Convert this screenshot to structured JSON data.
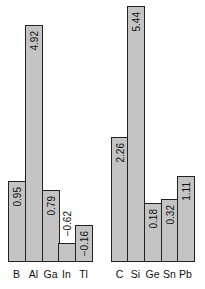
{
  "chart_data": [
    {
      "type": "bar",
      "title": "",
      "xlabel": "",
      "ylabel": "",
      "categories": [
        "B",
        "Al",
        "Ga",
        "In",
        "Tl"
      ],
      "values": [
        0.95,
        4.92,
        0.79,
        -0.62,
        -0.16
      ],
      "value_labels": [
        "0.95",
        "4.92",
        "0.79",
        "−0.62",
        "−0.16"
      ],
      "grid": false,
      "legend": null
    },
    {
      "type": "bar",
      "title": "",
      "xlabel": "",
      "ylabel": "",
      "categories": [
        "C",
        "Si",
        "Ge",
        "Sn",
        "Pb"
      ],
      "values": [
        2.26,
        5.44,
        0.18,
        0.32,
        1.11
      ],
      "value_labels": [
        "2.26",
        "5.44",
        "0.18",
        "0.32",
        "1.11"
      ],
      "grid": false,
      "legend": null
    }
  ],
  "colors": {
    "bar_fill": "#c4c4c4",
    "bar_stroke": "#222222"
  },
  "layout": {
    "baseline_y": 262,
    "bars": [
      {
        "x": 8,
        "top": 181
      },
      {
        "x": 25,
        "top": 25
      },
      {
        "x": 42,
        "top": 190
      },
      {
        "x": 58,
        "top": 243
      },
      {
        "x": 75,
        "top": 225
      },
      {
        "x": 111,
        "top": 137
      },
      {
        "x": 127,
        "top": 6
      },
      {
        "x": 144,
        "top": 203
      },
      {
        "x": 161,
        "top": 199
      },
      {
        "x": 177,
        "top": 176
      }
    ]
  }
}
